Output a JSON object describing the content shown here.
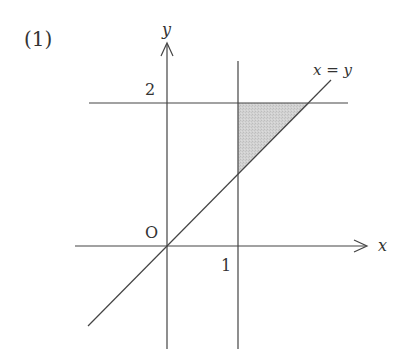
{
  "figure": {
    "label": "(1)",
    "axes": {
      "x_label": "x",
      "y_label": "y",
      "origin_label": "O"
    },
    "ticks": {
      "x_tick": "1",
      "y_tick": "2"
    },
    "lines": {
      "diagonal_label": "x = y",
      "vertical_line": "x = 1",
      "horizontal_line": "y = 2"
    },
    "region": {
      "description": "Shaded triangle bounded by x = 1, y = 2, and y = x",
      "vertices": [
        [
          1,
          1
        ],
        [
          1,
          2
        ],
        [
          2,
          2
        ]
      ],
      "fill_color": "#cfcfcf"
    },
    "colors": {
      "line": "#444444",
      "text": "#333333",
      "fill": "#cfcfcf"
    }
  }
}
